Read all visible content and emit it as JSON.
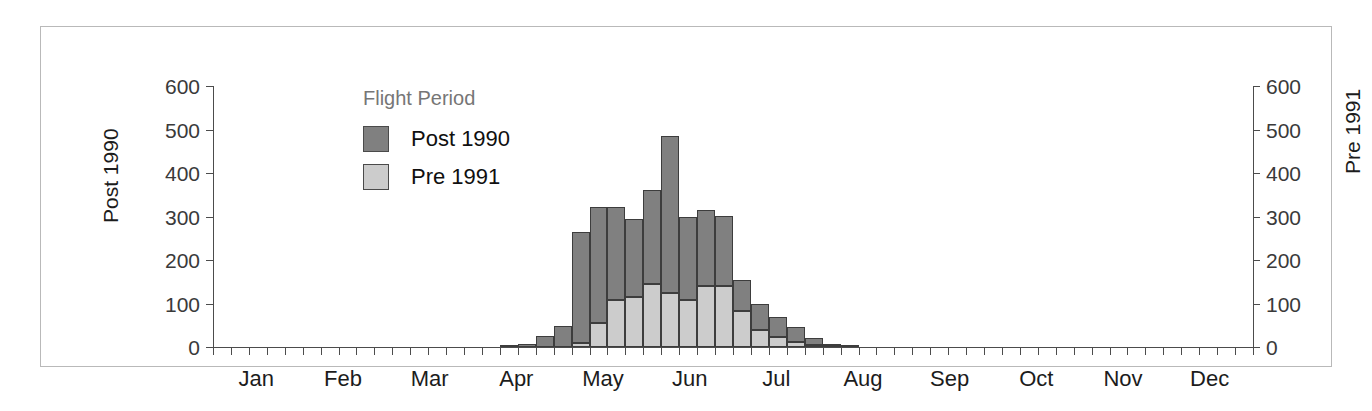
{
  "legend": {
    "title": "Flight Period",
    "entries": [
      {
        "label": "Post 1990",
        "color": "#808080"
      },
      {
        "label": "Pre 1991",
        "color": "#cccccc"
      }
    ]
  },
  "axes": {
    "left_title": "Post 1990",
    "right_title": "Pre 1991",
    "y_ticks": [
      0,
      100,
      200,
      300,
      400,
      500,
      600
    ],
    "y_min": 0,
    "y_max": 600,
    "x_months": [
      "Jan",
      "Feb",
      "Mar",
      "Apr",
      "May",
      "Jun",
      "Jul",
      "Aug",
      "Sep",
      "Oct",
      "Nov",
      "Dec"
    ]
  },
  "colors": {
    "post_1990": "#808080",
    "pre_1991": "#cccccc",
    "bar_outline": "#3d3d3d",
    "axis": "#4c4c4c",
    "frame": "#b9b9b9",
    "legend_title": "#767676",
    "text": "#1c1c1c",
    "background": "#ffffff"
  },
  "chart_data": {
    "type": "bar",
    "subtype": "stacked-histogram",
    "title": "",
    "xlabel": "",
    "ylabel": "Post 1990",
    "ylabel_right": "Pre 1991",
    "ylim": [
      0,
      600
    ],
    "yticks": [
      0,
      100,
      200,
      300,
      400,
      500,
      600
    ],
    "grid": false,
    "legend_title": "Flight Period",
    "legend_position": "inside-upper-left",
    "x_unit": "week",
    "x_axis_months": [
      "Jan",
      "Feb",
      "Mar",
      "Apr",
      "May",
      "Jun",
      "Jul",
      "Aug",
      "Sep",
      "Oct",
      "Nov",
      "Dec"
    ],
    "weeks_per_month": 4.333,
    "note": "Stacked bars: lower light-gray segment = Pre 1991, upper dark-gray segment = Post 1990. Bar total = stacked height.",
    "categories": [
      "Jan w1",
      "Jan w2",
      "Jan w3",
      "Jan w4",
      "Feb w1",
      "Feb w2",
      "Feb w3",
      "Feb w4",
      "Mar w1",
      "Mar w2",
      "Mar w3",
      "Mar w4",
      "Apr w1",
      "Apr w2",
      "Apr w3",
      "Apr w4",
      "May w1",
      "May w2",
      "May w3",
      "May w4",
      "Jun w1",
      "Jun w2",
      "Jun w3",
      "Jun w4",
      "Jul w1",
      "Jul w2",
      "Jul w3",
      "Jul w4",
      "Aug w1",
      "Aug w2",
      "Aug w3",
      "Aug w4",
      "Sep w1",
      "Sep w2",
      "Sep w3",
      "Sep w4",
      "Oct w1",
      "Oct w2",
      "Oct w3",
      "Oct w4",
      "Nov w1",
      "Nov w2",
      "Nov w3",
      "Nov w4",
      "Dec w1",
      "Dec w2",
      "Dec w3",
      "Dec w4"
    ],
    "series": [
      {
        "name": "Pre 1991",
        "color": "#cccccc",
        "stack_order": "bottom",
        "values": [
          0,
          0,
          0,
          0,
          0,
          0,
          0,
          0,
          0,
          0,
          0,
          0,
          0,
          0,
          0,
          0,
          0,
          0,
          0,
          0,
          10,
          55,
          108,
          115,
          145,
          125,
          108,
          140,
          140,
          82,
          40,
          22,
          12,
          5,
          2,
          0,
          0,
          0,
          0,
          0,
          0,
          0,
          0,
          0,
          0,
          0,
          0,
          0
        ]
      },
      {
        "name": "Post 1990",
        "color": "#808080",
        "stack_order": "top",
        "values": [
          0,
          0,
          0,
          0,
          0,
          0,
          0,
          0,
          0,
          0,
          0,
          0,
          0,
          0,
          0,
          0,
          3,
          8,
          25,
          48,
          255,
          268,
          215,
          180,
          215,
          360,
          192,
          175,
          162,
          72,
          58,
          48,
          35,
          15,
          5,
          3,
          0,
          0,
          0,
          0,
          0,
          0,
          0,
          0,
          0,
          0,
          0,
          0
        ]
      }
    ],
    "totals": [
      0,
      0,
      0,
      0,
      0,
      0,
      0,
      0,
      0,
      0,
      0,
      0,
      0,
      0,
      0,
      0,
      3,
      8,
      25,
      48,
      265,
      323,
      323,
      295,
      360,
      485,
      300,
      315,
      302,
      154,
      98,
      70,
      47,
      20,
      7,
      3,
      0,
      0,
      0,
      0,
      0,
      0,
      0,
      0,
      0,
      0,
      0,
      0
    ],
    "peak": {
      "category": "Jul w2",
      "total": 485
    }
  }
}
